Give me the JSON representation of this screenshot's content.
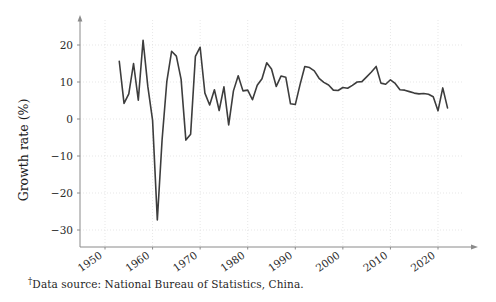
{
  "chart_data": {
    "type": "line",
    "title": "",
    "subtitle": "",
    "xlabel": "",
    "ylabel": "Growth rate (%)",
    "xlim": [
      1950,
      2026
    ],
    "ylim": [
      -30,
      25
    ],
    "xticks": [
      1950,
      1960,
      1970,
      1980,
      1990,
      2000,
      2010,
      2020
    ],
    "xtick_labels": [
      "1950",
      "1960",
      "1970",
      "1980",
      "1990",
      "2000",
      "2010",
      "2020"
    ],
    "yticks": [
      -30,
      -20,
      -10,
      0,
      10,
      20
    ],
    "ytick_labels": [
      "-30",
      "-20",
      "-10",
      "0",
      "10",
      "20"
    ],
    "grid": true,
    "grid_color": "#dcdcdc",
    "legend": null,
    "legend_position": "none",
    "line_color": "#3d3d3d",
    "line_width": 1.6,
    "axis_color": "#8a8a8a",
    "x": [
      1953,
      1954,
      1955,
      1956,
      1957,
      1958,
      1959,
      1960,
      1961,
      1962,
      1963,
      1964,
      1965,
      1966,
      1967,
      1968,
      1969,
      1970,
      1971,
      1972,
      1973,
      1974,
      1975,
      1976,
      1977,
      1978,
      1979,
      1980,
      1981,
      1982,
      1983,
      1984,
      1985,
      1986,
      1987,
      1988,
      1989,
      1990,
      1991,
      1992,
      1993,
      1994,
      1995,
      1996,
      1997,
      1998,
      1999,
      2000,
      2001,
      2002,
      2003,
      2004,
      2005,
      2006,
      2007,
      2008,
      2009,
      2010,
      2011,
      2012,
      2013,
      2014,
      2015,
      2016,
      2017,
      2018,
      2019,
      2020,
      2021,
      2022
    ],
    "values": [
      15.6,
      4.2,
      6.8,
      15.0,
      5.1,
      21.3,
      8.8,
      -0.3,
      -27.3,
      -5.6,
      10.2,
      18.3,
      17.0,
      10.7,
      -5.7,
      -4.1,
      16.9,
      19.4,
      7.0,
      3.8,
      7.9,
      2.3,
      8.7,
      -1.6,
      7.6,
      11.7,
      7.6,
      7.8,
      5.2,
      9.1,
      10.9,
      15.2,
      13.5,
      8.8,
      11.6,
      11.3,
      4.1,
      3.9,
      9.3,
      14.2,
      13.9,
      13.0,
      11.0,
      9.9,
      9.2,
      7.8,
      7.7,
      8.5,
      8.3,
      9.1,
      10.0,
      10.1,
      11.4,
      12.7,
      14.2,
      9.7,
      9.4,
      10.6,
      9.6,
      7.9,
      7.8,
      7.4,
      7.0,
      6.8,
      6.9,
      6.7,
      6.0,
      2.2,
      8.4,
      3.0
    ]
  },
  "footnote": {
    "marker": "†",
    "text": "Data source: National Bureau of Statistics, China."
  }
}
